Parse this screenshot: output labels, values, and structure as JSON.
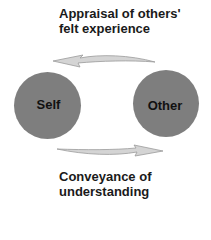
{
  "diagram": {
    "top_arrow": {
      "label_line1": "Appraisal of others'",
      "label_line2": "felt experience",
      "direction": "right-to-left",
      "from": "Other",
      "to": "Self"
    },
    "bottom_arrow": {
      "label_line1": "Conveyance of",
      "label_line2": "understanding",
      "direction": "left-to-right",
      "from": "Self",
      "to": "Other"
    },
    "nodes": [
      {
        "id": "self",
        "label": "Self"
      },
      {
        "id": "other",
        "label": "Other"
      }
    ],
    "colors": {
      "node_fill": "#7e7e7e",
      "arrow_fill": "#d4d4d4",
      "arrow_stroke": "#9a9a9a",
      "text": "#1a1a1a"
    }
  }
}
